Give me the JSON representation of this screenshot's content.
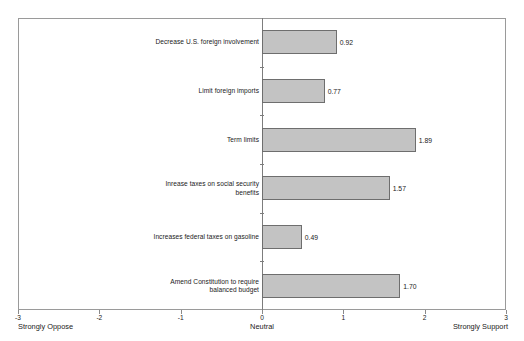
{
  "chart_data": {
    "type": "bar",
    "orientation": "horizontal",
    "title": "",
    "subtitle": "",
    "xlabel": "",
    "ylabel": "",
    "xlim": [
      -3,
      3
    ],
    "grid": false,
    "legend": false,
    "categories": [
      "Decrease U.S. foreign involvement",
      "Limit foreign imports",
      "Term limits",
      "Inrease taxes on social security\nbenefits",
      "Increases federal taxes on gasoline",
      "Amend Constitution to require\nbalanced budget"
    ],
    "values": [
      0.92,
      0.77,
      1.89,
      1.57,
      0.49,
      1.7
    ],
    "value_labels": [
      "0.92",
      "0.77",
      "1.89",
      "1.57",
      "0.49",
      "1.70"
    ],
    "xticks": [
      -3,
      -2,
      -1,
      0,
      1,
      2,
      3
    ],
    "xtick_labels": [
      "-3",
      "-2",
      "-1",
      "0",
      "1",
      "2",
      "3"
    ],
    "axis_end_labels": {
      "left": "Strongly Oppose",
      "center": "Neutral",
      "right": "Strongly Support"
    },
    "colors": {
      "bar_fill": "#c3c3c3",
      "bar_border": "#6e6e6e",
      "frame": "#9a9a9a",
      "axis": "#7d7d7d",
      "text": "#1a1a1a",
      "background": "#ffffff"
    }
  }
}
